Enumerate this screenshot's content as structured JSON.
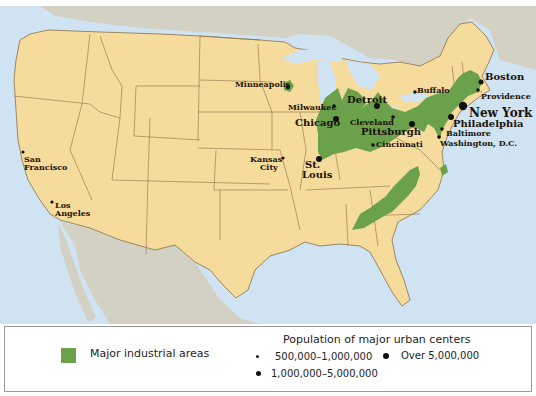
{
  "map": {
    "title": "Major industrial areas and urban centers of the United States",
    "colors": {
      "ocean": "#cfe3f3",
      "us_land": "#f6dc9c",
      "foreign_land": "#d3d1c4",
      "state_border": "#8a6f45",
      "industrial": "#6aa14a"
    },
    "cities": [
      {
        "name": "Minneapolis",
        "size": "small",
        "lines": [
          "Minneapolis"
        ]
      },
      {
        "name": "Milwaukee",
        "size": "small",
        "lines": [
          "Milwaukee"
        ]
      },
      {
        "name": "Chicago",
        "size": "medium",
        "lines": [
          "Chicago"
        ]
      },
      {
        "name": "Detroit",
        "size": "medium",
        "lines": [
          "Detroit"
        ]
      },
      {
        "name": "Cleveland",
        "size": "small",
        "lines": [
          "Cleveland"
        ]
      },
      {
        "name": "Pittsburgh",
        "size": "medium",
        "lines": [
          "Pittsburgh"
        ]
      },
      {
        "name": "Cincinnati",
        "size": "small",
        "lines": [
          "Cincinnati"
        ]
      },
      {
        "name": "Buffalo",
        "size": "small",
        "lines": [
          "Buffalo"
        ]
      },
      {
        "name": "Boston",
        "size": "medium",
        "lines": [
          "Boston"
        ]
      },
      {
        "name": "Providence",
        "size": "small",
        "lines": [
          "Providence"
        ]
      },
      {
        "name": "New York",
        "size": "large",
        "lines": [
          "New York"
        ]
      },
      {
        "name": "Philadelphia",
        "size": "medium",
        "lines": [
          "Philadelphia"
        ]
      },
      {
        "name": "Baltimore",
        "size": "small",
        "lines": [
          "Baltimore"
        ]
      },
      {
        "name": "Washington, D.C.",
        "size": "small",
        "lines": [
          "Washington, D.C."
        ]
      },
      {
        "name": "St. Louis",
        "size": "medium",
        "lines": [
          "St.",
          "Louis"
        ]
      },
      {
        "name": "Kansas City",
        "size": "small",
        "lines": [
          "Kansas",
          "City"
        ]
      },
      {
        "name": "San Francisco",
        "size": "small",
        "lines": [
          "San",
          "Francisco"
        ]
      },
      {
        "name": "Los Angeles",
        "size": "small",
        "lines": [
          "Los",
          "Angeles"
        ]
      }
    ]
  },
  "legend": {
    "industrial_label": "Major industrial areas",
    "population_title": "Population of major urban centers",
    "sizes": [
      {
        "label": "500,000–1,000,000",
        "key": "small"
      },
      {
        "label": "1,000,000–5,000,000",
        "key": "medium"
      },
      {
        "label": "Over 5,000,000",
        "key": "large"
      }
    ]
  }
}
